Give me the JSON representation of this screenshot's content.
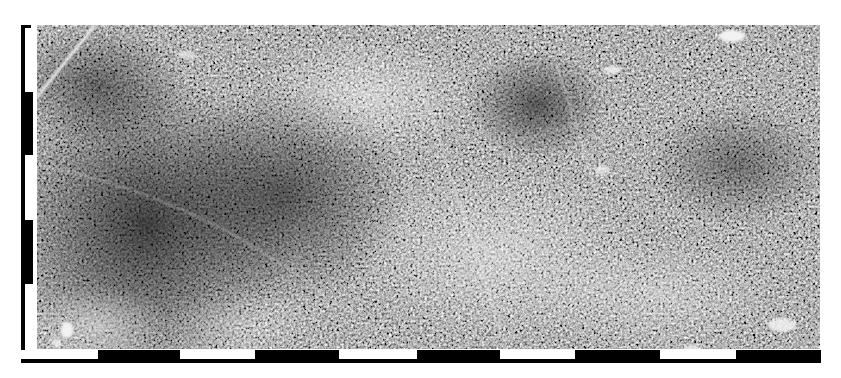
{
  "figure": {
    "kind": "aerial-photograph",
    "imagery": {
      "x": 37,
      "y": 25,
      "width": 783,
      "height": 324,
      "base_tone": "#8a8a8a",
      "dark_tone": "#1e1e1e",
      "light_tone": "#d8d8d8"
    },
    "scale_bar_vertical": {
      "color_dark": "#000000",
      "color_light": "#ffffff",
      "segments": [
        {
          "start": 0,
          "end": 67,
          "fill": "light"
        },
        {
          "start": 67,
          "end": 130,
          "fill": "dark"
        },
        {
          "start": 130,
          "end": 195,
          "fill": "light"
        },
        {
          "start": 195,
          "end": 259,
          "fill": "dark"
        },
        {
          "start": 259,
          "end": 325,
          "fill": "light"
        }
      ]
    },
    "scale_bar_horizontal": {
      "color_dark": "#000000",
      "color_light": "#ffffff",
      "segments": [
        {
          "start": 0,
          "end": 77,
          "fill": "light"
        },
        {
          "start": 77,
          "end": 159,
          "fill": "dark"
        },
        {
          "start": 159,
          "end": 234,
          "fill": "light"
        },
        {
          "start": 234,
          "end": 318,
          "fill": "dark"
        },
        {
          "start": 318,
          "end": 396,
          "fill": "light"
        },
        {
          "start": 396,
          "end": 479,
          "fill": "dark"
        },
        {
          "start": 479,
          "end": 554,
          "fill": "light"
        },
        {
          "start": 554,
          "end": 639,
          "fill": "dark"
        },
        {
          "start": 639,
          "end": 715,
          "fill": "light"
        },
        {
          "start": 715,
          "end": 800,
          "fill": "dark"
        }
      ]
    },
    "features": [
      {
        "name": "diagonal-road-northwest",
        "type": "road"
      },
      {
        "name": "north-south-track-center",
        "type": "track"
      },
      {
        "name": "clearing-northeast",
        "type": "clearing"
      },
      {
        "name": "clearing-southwest",
        "type": "clearing"
      },
      {
        "name": "clearing-southeast",
        "type": "clearing"
      },
      {
        "name": "dense-forest-west",
        "type": "dense-canopy"
      },
      {
        "name": "cultivated-grid-east",
        "type": "plantation"
      }
    ]
  }
}
